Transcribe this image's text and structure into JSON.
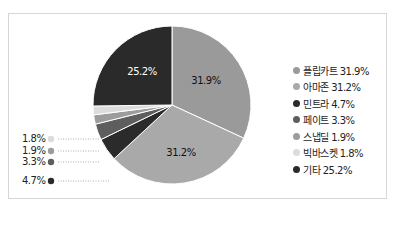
{
  "chart_data": {
    "type": "pie",
    "title": "",
    "categories": [
      "플립카트",
      "아마존",
      "민트라",
      "페이트",
      "스냅딜",
      "빅바스켓",
      "기타"
    ],
    "values": [
      31.9,
      31.2,
      4.7,
      3.3,
      1.9,
      1.8,
      25.2
    ],
    "colors": [
      "#9a9a9a",
      "#a9a9a9",
      "#2b2b2b",
      "#5e5e5e",
      "#9c9c9c",
      "#dcdcdc",
      "#2a2a2a"
    ],
    "slice_labels": [
      "31.9%",
      "31.2%",
      "4.7%",
      "3.3%",
      "1.9%",
      "1.8%",
      "25.2%"
    ],
    "legend": {
      "position": "right",
      "entries": [
        "플립카트 31.9%",
        "아마존 31.2%",
        "민트라 4.7%",
        "페이트 3.3%",
        "스냅딜 1.9%",
        "빅바스켓 1.8%",
        "기타 25.2%"
      ]
    },
    "callouts_left": [
      "1.8%",
      "1.9%",
      "3.3%",
      "4.7%"
    ]
  },
  "legend": {
    "items": [
      {
        "label": "플립카트 31.9%",
        "color": "#9a9a9a"
      },
      {
        "label": "아마존 31.2%",
        "color": "#a9a9a9"
      },
      {
        "label": "민트라 4.7%",
        "color": "#2b2b2b"
      },
      {
        "label": "페이트 3.3%",
        "color": "#5e5e5e"
      },
      {
        "label": "스냅딜 1.9%",
        "color": "#9c9c9c"
      },
      {
        "label": "빅바스켓 1.8%",
        "color": "#dcdcdc"
      },
      {
        "label": "기타 25.2%",
        "color": "#2a2a2a"
      }
    ]
  },
  "callouts": [
    {
      "label": "1.8%",
      "color": "#dcdcdc",
      "y": 139
    },
    {
      "label": "1.9%",
      "color": "#9c9c9c",
      "y": 151
    },
    {
      "label": "3.3%",
      "color": "#5e5e5e",
      "y": 162
    },
    {
      "label": "4.7%",
      "color": "#2b2b2b",
      "y": 181
    }
  ],
  "slice_text": {
    "flipkart": "31.9%",
    "amazon": "31.2%",
    "others": "25.2%"
  }
}
